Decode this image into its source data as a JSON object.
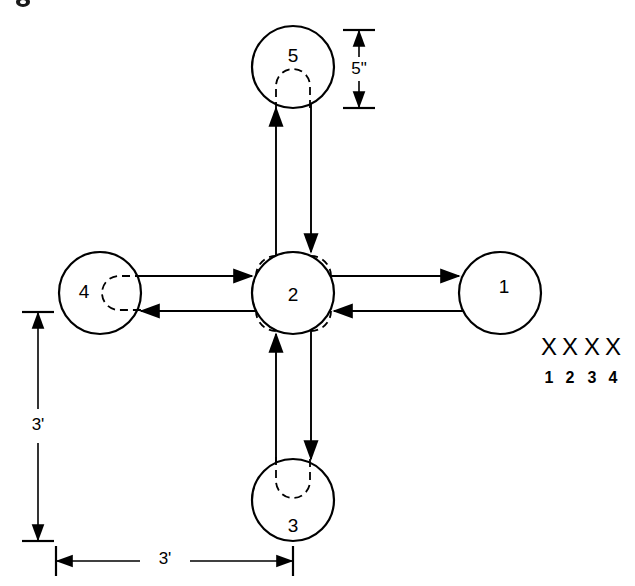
{
  "figure": {
    "stations": [
      {
        "id": "station-1",
        "label": "1",
        "position": "right",
        "cx": 500,
        "cy": 293,
        "r": 41,
        "hidden_feature": "none"
      },
      {
        "id": "station-2",
        "label": "2",
        "position": "center",
        "cx": 293,
        "cy": 293,
        "r": 41,
        "hidden_feature": "four-corner-arcs"
      },
      {
        "id": "station-3",
        "label": "3",
        "position": "bottom",
        "cx": 293,
        "cy": 500,
        "r": 41,
        "hidden_feature": "u-slot-up"
      },
      {
        "id": "station-4",
        "label": "4",
        "position": "left",
        "cx": 100,
        "cy": 293,
        "r": 41,
        "hidden_feature": "u-slot-right"
      },
      {
        "id": "station-5",
        "label": "5",
        "position": "top",
        "cx": 293,
        "cy": 67,
        "r": 41,
        "hidden_feature": "u-slot-down"
      }
    ],
    "flows": [
      {
        "id": "flow-2-to-1",
        "from": "2",
        "to": "1",
        "direction": "right"
      },
      {
        "id": "flow-1-to-2",
        "from": "1",
        "to": "2",
        "direction": "left"
      },
      {
        "id": "flow-4-to-2",
        "from": "4",
        "to": "2",
        "direction": "right"
      },
      {
        "id": "flow-2-to-4",
        "from": "2",
        "to": "4",
        "direction": "left"
      },
      {
        "id": "flow-2-to-5",
        "from": "2",
        "to": "5",
        "direction": "up"
      },
      {
        "id": "flow-5-to-2",
        "from": "5",
        "to": "2",
        "direction": "down"
      },
      {
        "id": "flow-3-to-2",
        "from": "3",
        "to": "2",
        "direction": "up"
      },
      {
        "id": "flow-2-to-3",
        "from": "2",
        "to": "3",
        "direction": "down"
      }
    ],
    "dimensions": [
      {
        "id": "dim-vertical",
        "label": "3'",
        "orientation": "vertical",
        "span": "station-4 to station-3"
      },
      {
        "id": "dim-horizontal",
        "label": "3'",
        "orientation": "horizontal",
        "span": "station-4 to station-3"
      },
      {
        "id": "dim-diameter",
        "label": "5\"",
        "orientation": "vertical",
        "span": "station-5 diameter"
      }
    ],
    "legend": {
      "marks": [
        "X",
        "X",
        "X",
        "X"
      ],
      "numbers": [
        "1",
        "2",
        "3",
        "4"
      ]
    }
  }
}
